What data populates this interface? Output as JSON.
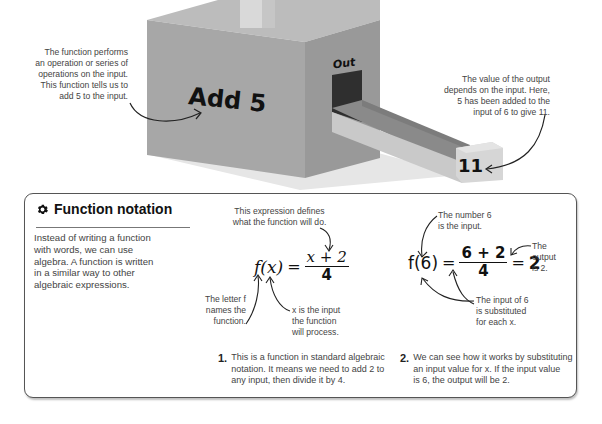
{
  "machine": {
    "label": "Add 5",
    "out_label": "Out",
    "output_value": "11",
    "colors": {
      "front": "#a8a8a8",
      "side": "#9a9a9a",
      "top": "#bdbdbd",
      "chute_dark": "#8c8c8c",
      "chute_light": "#c8c8c8",
      "opening": "#333333"
    }
  },
  "annotations": {
    "function_note": [
      "The function performs",
      "an operation or series of",
      "operations on the input.",
      "This function tells us to",
      "add 5 to the input."
    ],
    "output_note": [
      "The value of the output",
      "depends on the input. Here,",
      "5 has been added to the",
      "input of 6 to give 11."
    ]
  },
  "panel": {
    "title": "Function notation",
    "icon": "gear-icon",
    "intro": [
      "Instead of writing a function",
      "with words, we can use",
      "algebra. A function is written",
      "in a similar way to other",
      "algebraic expressions."
    ],
    "example1": {
      "lhs": "f(x)",
      "equals": "=",
      "numerator": "x + 2",
      "denominator": "4",
      "note_top": [
        "This expression defines",
        "what the function will do."
      ],
      "note_f": [
        "The letter f",
        "names the",
        "function."
      ],
      "note_x": [
        "x is the input",
        "the function",
        "will process."
      ]
    },
    "example2": {
      "lhs": "f(6)",
      "equals": "=",
      "numerator": "6 + 2",
      "denominator": "4",
      "equals2": "=",
      "result": "2",
      "note_input": [
        "The number 6",
        "is the input."
      ],
      "note_output": [
        "The",
        "output",
        "is 2."
      ],
      "note_subst": [
        "The input of 6",
        "is substituted",
        "for each x."
      ]
    },
    "steps": [
      {
        "num": "1.",
        "text": [
          "This is a function in standard algebraic",
          "notation. It means we need to add 2 to",
          "any input, then divide it by 4."
        ]
      },
      {
        "num": "2.",
        "text": [
          "We can see how it works by substituting",
          "an input value for x. If the input value",
          "is 6, the output will be 2."
        ]
      }
    ]
  }
}
